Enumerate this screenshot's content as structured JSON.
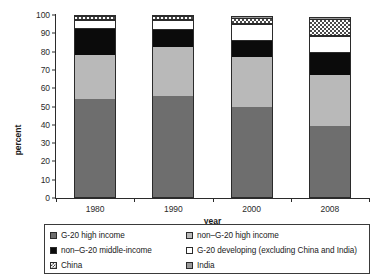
{
  "chart_data": {
    "type": "bar",
    "subtype": "stacked-bar-100-percent",
    "title": "",
    "xlabel": "year",
    "ylabel": "percent",
    "categories": [
      "1980",
      "1990",
      "2000",
      "2008"
    ],
    "ylim": [
      0,
      100
    ],
    "yticks": [
      0,
      10,
      20,
      30,
      40,
      50,
      60,
      70,
      80,
      90,
      100
    ],
    "ytick_labels": [
      "0",
      "10",
      "20",
      "30",
      "40",
      "50",
      "60",
      "70",
      "80",
      "90",
      "100"
    ],
    "grid": false,
    "legend_position": "bottom",
    "stack_order_bottom_to_top": [
      "G-20 high income",
      "non–G-20 high income",
      "non–G-20 middle-income",
      "G-20 developing (excluding China and India)",
      "China",
      "India"
    ],
    "series": [
      {
        "name": "G-20 high income",
        "key": "g20high",
        "color": "#6e6e6e",
        "pattern": "solid",
        "values": [
          54.0,
          55.5,
          49.5,
          39.5
        ]
      },
      {
        "name": "non–G-20 high income",
        "key": "nong20high",
        "color": "#b9b9b9",
        "pattern": "solid",
        "values": [
          24.0,
          27.0,
          27.5,
          27.5
        ]
      },
      {
        "name": "non–G-20 middle-income",
        "key": "nong20mid",
        "color": "#0b0b0b",
        "pattern": "solid",
        "values": [
          14.5,
          9.5,
          9.0,
          12.5
        ]
      },
      {
        "name": "G-20 developing (excluding China and India)",
        "key": "g20dev",
        "color": "#ffffff",
        "pattern": "solid",
        "values": [
          5.0,
          5.5,
          9.0,
          9.0
        ]
      },
      {
        "name": "China",
        "key": "china",
        "color": "#ffffff",
        "pattern": "checkered",
        "values": [
          2.0,
          2.0,
          3.5,
          9.5
        ]
      },
      {
        "name": "India",
        "key": "india",
        "color": "#9a9a9a",
        "pattern": "solid",
        "values": [
          0.5,
          0.5,
          1.0,
          1.0
        ]
      }
    ],
    "cumulative_tops": [
      [
        54.0,
        78.0,
        92.5,
        97.5,
        99.5,
        100.0
      ],
      [
        55.5,
        82.5,
        92.0,
        97.5,
        99.5,
        100.0
      ],
      [
        49.5,
        77.0,
        86.0,
        95.0,
        98.5,
        99.5
      ],
      [
        39.5,
        67.0,
        79.5,
        88.5,
        98.0,
        99.0
      ]
    ]
  },
  "axes": {
    "ylabel": "percent",
    "xlabel": "year"
  },
  "legend": {
    "items": [
      {
        "label": "G-20 high income",
        "key": "g20high"
      },
      {
        "label": "non–G-20 high income",
        "key": "nong20high"
      },
      {
        "label": "non–G-20 middle-income",
        "key": "nong20mid"
      },
      {
        "label": "G-20 developing (excluding China and India)",
        "key": "g20dev"
      },
      {
        "label": "China",
        "key": "china"
      },
      {
        "label": "India",
        "key": "india"
      }
    ]
  },
  "colors": {
    "g20_high_income": "#6e6e6e",
    "non_g20_high_income": "#b9b9b9",
    "non_g20_middle_income": "#0b0b0b",
    "g20_developing": "#ffffff",
    "china": "#ffffff",
    "india": "#9a9a9a",
    "axis": "#2b2b2b",
    "background": "#ffffff"
  }
}
